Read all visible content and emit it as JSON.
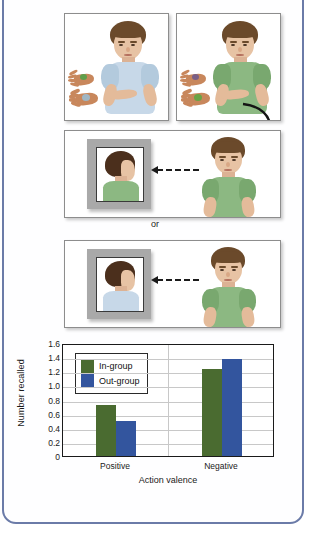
{
  "figure": {
    "separator_label": "or",
    "panels": [
      {
        "name": "ingroup-actor",
        "shirt_color": "#c7d8e8",
        "shirt_group": "In-group",
        "description": "Boy in light blue shirt placing objects on hands"
      },
      {
        "name": "outgroup-actor",
        "shirt_color": "#8cb882",
        "shirt_group": "Out-group",
        "description": "Boy in green shirt placing objects on hands"
      },
      {
        "name": "mirror-green-observer",
        "shirt_color": "#8cb882",
        "mirror_shirt_color": "#8cb882",
        "description": "Green-shirt boy viewing green-shirt image in mirror"
      },
      {
        "name": "mirror-blue-observer",
        "shirt_color": "#8cb882",
        "mirror_shirt_color": "#c7d8e8",
        "description": "Green-shirt boy viewing blue-shirt image in mirror"
      }
    ]
  },
  "chart_data": {
    "type": "bar",
    "title": "",
    "xlabel": "Action valence",
    "ylabel": "Number recalled",
    "categories": [
      "Positive",
      "Negative"
    ],
    "ylim": [
      0,
      1.6
    ],
    "ytick_labels": [
      "1.6",
      "1.4",
      "1.2",
      "1.0",
      "0.8",
      "0.6",
      "0.4",
      "0.2",
      "0"
    ],
    "ytick_values": [
      1.6,
      1.4,
      1.2,
      1.0,
      0.8,
      0.6,
      0.4,
      0.2,
      0
    ],
    "grid": true,
    "legend_position": "top-left",
    "series": [
      {
        "name": "In-group",
        "color": "#4a6b30",
        "values": [
          0.72,
          1.23
        ]
      },
      {
        "name": "Out-group",
        "color": "#33559e",
        "values": [
          0.5,
          1.38
        ]
      }
    ]
  }
}
